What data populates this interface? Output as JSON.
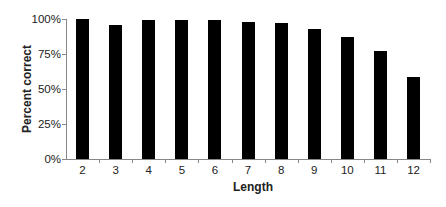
{
  "chart_data": {
    "type": "bar",
    "title": "",
    "xlabel": "Length",
    "ylabel": "Percent correct",
    "categories": [
      "2",
      "3",
      "4",
      "5",
      "6",
      "7",
      "8",
      "9",
      "10",
      "11",
      "12"
    ],
    "values": [
      100,
      96,
      99,
      99,
      99,
      98,
      97,
      93,
      87.5,
      77,
      58.5
    ],
    "value_unit": "%",
    "ylim": [
      0,
      100
    ],
    "yticks": [
      "0%",
      "25%",
      "50%",
      "75%",
      "100%"
    ],
    "grid": false,
    "legend": null,
    "bar_color": "#000000"
  }
}
